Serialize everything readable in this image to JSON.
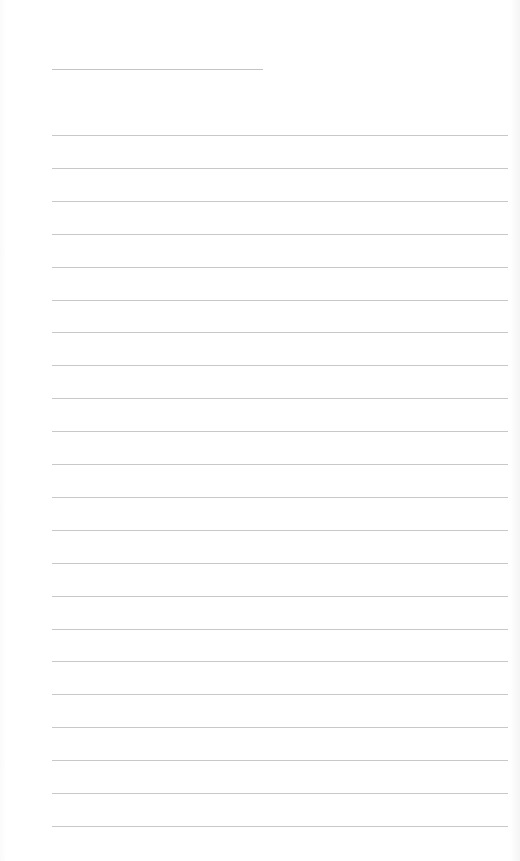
{
  "page": {
    "type": "lined-paper",
    "background_color": "#ffffff",
    "line_color": "#c8c8c8"
  },
  "title_line": {
    "label": "",
    "x": 52,
    "y": 69,
    "width": 211
  },
  "ruled_lines": {
    "count": 22,
    "start_y": 135,
    "spacing": 32.9,
    "x": 52,
    "width": 456,
    "texts": [
      "",
      "",
      "",
      "",
      "",
      "",
      "",
      "",
      "",
      "",
      "",
      "",
      "",
      "",
      "",
      "",
      "",
      "",
      "",
      "",
      "",
      ""
    ]
  }
}
